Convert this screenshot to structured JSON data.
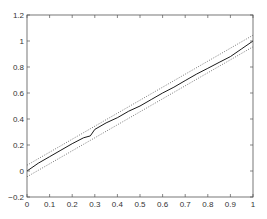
{
  "chart_data": {
    "type": "line",
    "title": "",
    "xlabel": "",
    "ylabel": "",
    "xlim": [
      0,
      1
    ],
    "ylim": [
      -0.2,
      1.2
    ],
    "grid": false,
    "legend": null,
    "x_ticks": [
      "0",
      "0.1",
      "0.2",
      "0.3",
      "0.4",
      "0.5",
      "0.6",
      "0.7",
      "0.8",
      "0.9",
      "1"
    ],
    "y_ticks": [
      "-0.2",
      "0",
      "0.2",
      "0.4",
      "0.6",
      "0.8",
      "1",
      "1.2"
    ],
    "series": [
      {
        "name": "empirical",
        "style": "solid",
        "color": "#000000",
        "x": [
          0,
          0.05,
          0.1,
          0.15,
          0.2,
          0.25,
          0.28,
          0.3,
          0.35,
          0.4,
          0.45,
          0.5,
          0.55,
          0.6,
          0.65,
          0.7,
          0.75,
          0.8,
          0.85,
          0.9,
          0.95,
          1
        ],
        "values": [
          0.0,
          0.06,
          0.11,
          0.16,
          0.21,
          0.255,
          0.27,
          0.32,
          0.37,
          0.41,
          0.46,
          0.5,
          0.55,
          0.6,
          0.645,
          0.695,
          0.745,
          0.79,
          0.835,
          0.88,
          0.94,
          1.0
        ]
      },
      {
        "name": "upper-bound",
        "style": "dotted",
        "color": "#555555",
        "x": [
          0,
          1
        ],
        "values": [
          0.045,
          1.045
        ]
      },
      {
        "name": "lower-bound",
        "style": "dotted",
        "color": "#555555",
        "x": [
          0,
          1
        ],
        "values": [
          -0.045,
          0.955
        ]
      }
    ]
  }
}
